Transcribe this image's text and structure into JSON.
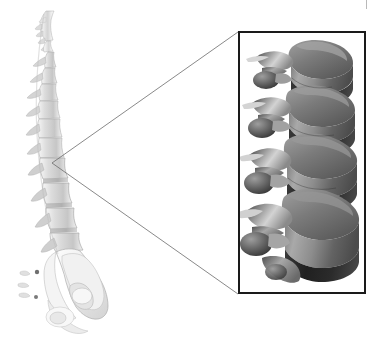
{
  "figure": {
    "background_color": "#ffffff",
    "width": 378,
    "height": 341
  },
  "spine_illustration": {
    "name": "lateral-spine",
    "description": "Grayscale lateral (side) view of the human vertebral column with sacrum and pelvis",
    "regions": [
      "cervical",
      "thoracic",
      "lumbar",
      "sacrum",
      "pelvis"
    ],
    "bone_color": "#d8d8d8",
    "shadow_color": "#9a9a9a",
    "outline_color": "#8e8e8e",
    "bounds": {
      "x": 8,
      "y": 8,
      "width": 110,
      "height": 330
    }
  },
  "callout": {
    "name": "magnifier-callout",
    "apex": {
      "x": 52,
      "y": 163
    },
    "line_color": "#6b6b6b",
    "line_width": 0.8,
    "upper_target": {
      "x": 238,
      "y": 32
    },
    "lower_target": {
      "x": 238,
      "y": 294
    }
  },
  "inset_box": {
    "name": "lumbar-detail-inset",
    "border_color": "#1a1a1a",
    "border_width": 2,
    "fill_color": "#ffffff",
    "x": 238,
    "y": 31,
    "width": 128,
    "height": 263,
    "content_description": "Three-dimensional rendered close-up of four lumbar vertebrae showing vertebral bodies, intervertebral discs, transverse processes and spinous processes",
    "vertebra_count": 4,
    "disc_color": "#2c2c2c",
    "body_light": "#c9c9c9",
    "body_mid": "#8c8c8c",
    "body_dark": "#4a4a4a",
    "process_light": "#dcdcdc",
    "process_dark": "#5a5a5a"
  },
  "page_marks": {
    "name": "scan-artifacts",
    "top_tick_color": "#b9b9b9",
    "marks": [
      {
        "x": 291,
        "y": 1,
        "width": 6,
        "height": 2
      },
      {
        "x": 366,
        "y": 0,
        "width": 1,
        "height": 9
      }
    ]
  }
}
